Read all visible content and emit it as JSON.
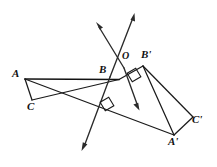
{
  "figure": {
    "background_color": "#ffffff",
    "stroke_color": "#1a1a1a",
    "width": 217,
    "height": 167
  },
  "labels": {
    "A": "A",
    "B": "B",
    "C": "C",
    "O": "O",
    "A_prime": "A'",
    "B_prime": "B'",
    "C_prime": "C'"
  },
  "points": {
    "A": {
      "x": 25,
      "y": 79,
      "label_x": 12,
      "label_y": 68
    },
    "B": {
      "x": 119,
      "y": 79,
      "label_x": 99,
      "label_y": 64
    },
    "C": {
      "x": 32,
      "y": 100,
      "label_x": 27,
      "label_y": 101
    },
    "O": {
      "x": 121,
      "y": 62,
      "label_x": 122,
      "label_y": 51
    },
    "A_prime": {
      "x": 174,
      "y": 135,
      "label_x": 168,
      "label_y": 136
    },
    "B_prime": {
      "x": 143,
      "y": 66,
      "label_x": 141,
      "label_y": 49
    },
    "C_prime": {
      "x": 193,
      "y": 117,
      "label_x": 192,
      "label_y": 114
    }
  },
  "segments": [
    {
      "name": "segment-AB",
      "from": "A",
      "to": "B"
    },
    {
      "name": "segment-AC",
      "from": "A",
      "to": "C"
    },
    {
      "name": "segment-CB",
      "from": "C",
      "to": "B"
    },
    {
      "name": "segment-A-to-Aprime",
      "from": "A",
      "to": "A_prime"
    },
    {
      "name": "segment-Aprime-Bprime",
      "from": "A_prime",
      "to": "B_prime"
    },
    {
      "name": "segment-Bprime-Cprime",
      "from": "B_prime",
      "to": "C_prime"
    },
    {
      "name": "segment-Cprime-Aprime",
      "from": "C_prime",
      "to": "A_prime"
    },
    {
      "name": "segment-B-to-Bprime",
      "from": "B",
      "to": "B_prime"
    }
  ],
  "rays": [
    {
      "name": "ray-upper-left",
      "x1": 121,
      "y1": 62,
      "x2": 97,
      "y2": 23,
      "arrow_at": "end"
    },
    {
      "name": "ray-upper-right",
      "x1": 112,
      "y1": 72,
      "x2": 134,
      "y2": 14,
      "arrow_at": "end"
    },
    {
      "name": "ray-lower-left",
      "x1": 121,
      "y1": 62,
      "x2": 82,
      "y2": 150,
      "arrow_at": "end"
    },
    {
      "name": "ray-lower-right",
      "x1": 121,
      "y1": 67,
      "x2": 139,
      "y2": 110,
      "arrow_at": "end"
    }
  ],
  "right_angle_marks": [
    {
      "name": "right-angle-mark-upper",
      "cx": 134,
      "cy": 75,
      "rotation": -31
    },
    {
      "name": "right-angle-mark-lower",
      "cx": 107,
      "cy": 104,
      "rotation": -31
    }
  ],
  "colors": {
    "ink": "#1a1a1a",
    "paper": "#ffffff"
  }
}
